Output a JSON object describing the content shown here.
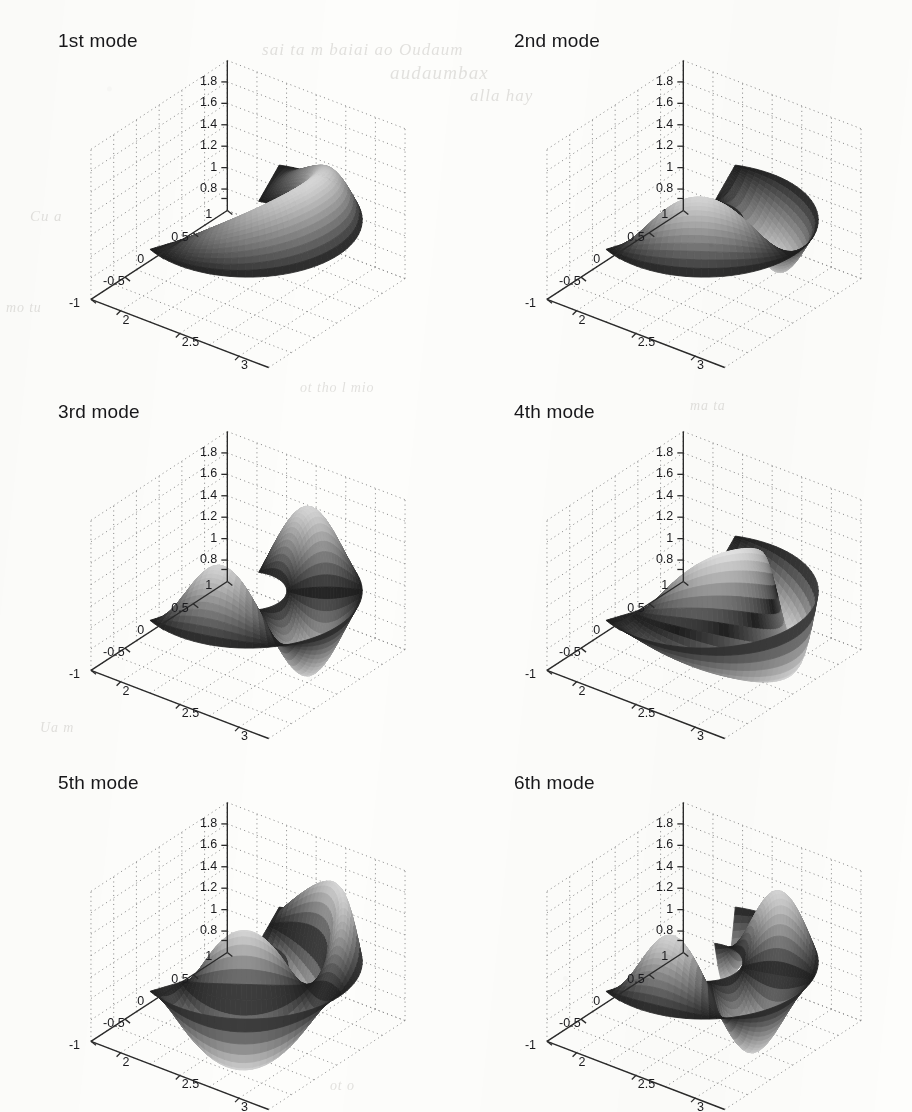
{
  "figure": {
    "kind": "multi-panel-3d-surface-figure",
    "rows": 3,
    "cols": 2,
    "background_color": "#fdfdfb",
    "ghost_text": [
      {
        "text": "sai ta m baiai ao Oudaum",
        "x": 262,
        "y": 40,
        "size": 17
      },
      {
        "text": "audaumbax",
        "x": 390,
        "y": 62,
        "size": 19
      },
      {
        "text": "alla  hay",
        "x": 470,
        "y": 86,
        "size": 17
      },
      {
        "text": "Cu a",
        "x": 30,
        "y": 208,
        "size": 15
      },
      {
        "text": "mo tu",
        "x": 6,
        "y": 300,
        "size": 14
      },
      {
        "text": "ot tho  l mio",
        "x": 300,
        "y": 380,
        "size": 14
      },
      {
        "text": "ma ta",
        "x": 690,
        "y": 398,
        "size": 14
      },
      {
        "text": "Ua  m",
        "x": 40,
        "y": 720,
        "size": 14
      },
      {
        "text": "ot o",
        "x": 330,
        "y": 1078,
        "size": 14
      }
    ]
  },
  "chart_data": [
    {
      "type": "surface",
      "title": "1st mode",
      "xlabel": "",
      "ylabel": "",
      "zlabel": "",
      "x_ticks": [
        "2",
        "2.5",
        "3"
      ],
      "y_ticks": [
        "1",
        "0.5",
        "0",
        "-0.5",
        "-1"
      ],
      "z_ticks": [
        "1.8",
        "1.6",
        "1.4",
        "1.2",
        "1",
        "0.8"
      ],
      "xlim": [
        1.75,
        3.25
      ],
      "ylim": [
        -1.15,
        1.15
      ],
      "zlim": [
        0.7,
        1.9
      ],
      "grid": true,
      "colormap": "gray",
      "domain": "annular-sector",
      "mode_index": 1,
      "nodal_circles": 0,
      "nodal_diameters": 0,
      "lobe_count": 1
    },
    {
      "type": "surface",
      "title": "2nd mode",
      "xlabel": "",
      "ylabel": "",
      "zlabel": "",
      "x_ticks": [
        "2",
        "2.5",
        "3"
      ],
      "y_ticks": [
        "1",
        "0.5",
        "0",
        "-0.5",
        "-1"
      ],
      "z_ticks": [
        "1.8",
        "1.6",
        "1.4",
        "1.2",
        "1",
        "0.8"
      ],
      "xlim": [
        1.75,
        3.25
      ],
      "ylim": [
        -1.15,
        1.15
      ],
      "zlim": [
        0.7,
        1.9
      ],
      "grid": true,
      "colormap": "gray",
      "domain": "annular-sector",
      "mode_index": 2,
      "nodal_circles": 0,
      "nodal_diameters": 1,
      "lobe_count": 2
    },
    {
      "type": "surface",
      "title": "3rd mode",
      "xlabel": "",
      "ylabel": "",
      "zlabel": "",
      "x_ticks": [
        "2",
        "2.5",
        "3"
      ],
      "y_ticks": [
        "1",
        "0.5",
        "0",
        "-0.5",
        "-1"
      ],
      "z_ticks": [
        "1.8",
        "1.6",
        "1.4",
        "1.2",
        "1",
        "0.8"
      ],
      "xlim": [
        1.75,
        3.25
      ],
      "ylim": [
        -1.15,
        1.15
      ],
      "zlim": [
        0.7,
        1.9
      ],
      "grid": true,
      "colormap": "gray",
      "domain": "annular-sector",
      "mode_index": 3,
      "nodal_circles": 0,
      "nodal_diameters": 2,
      "lobe_count": 3
    },
    {
      "type": "surface",
      "title": "4th mode",
      "xlabel": "",
      "ylabel": "",
      "zlabel": "",
      "x_ticks": [
        "2",
        "2.5",
        "3"
      ],
      "y_ticks": [
        "1",
        "0.5",
        "0",
        "-0.5",
        "-1"
      ],
      "z_ticks": [
        "1.8",
        "1.6",
        "1.4",
        "1.2",
        "1",
        "0.8"
      ],
      "xlim": [
        1.75,
        3.25
      ],
      "ylim": [
        -1.15,
        1.15
      ],
      "zlim": [
        0.7,
        1.9
      ],
      "grid": true,
      "colormap": "gray",
      "domain": "annular-sector",
      "mode_index": 4,
      "nodal_circles": 1,
      "nodal_diameters": 1,
      "lobe_count": 4
    },
    {
      "type": "surface",
      "title": "5th mode",
      "xlabel": "",
      "ylabel": "",
      "zlabel": "",
      "x_ticks": [
        "2",
        "2.5",
        "3"
      ],
      "y_ticks": [
        "1",
        "0.5",
        "0",
        "-0.5",
        "-1"
      ],
      "z_ticks": [
        "1.8",
        "1.6",
        "1.4",
        "1.2",
        "1",
        "0.8"
      ],
      "xlim": [
        1.75,
        3.25
      ],
      "ylim": [
        -1.15,
        1.15
      ],
      "zlim": [
        0.7,
        1.9
      ],
      "grid": true,
      "colormap": "gray",
      "domain": "annular-sector",
      "mode_index": 5,
      "nodal_circles": 1,
      "nodal_diameters": 2,
      "lobe_count": 4
    },
    {
      "type": "surface",
      "title": "6th mode",
      "xlabel": "",
      "ylabel": "",
      "zlabel": "",
      "x_ticks": [
        "2",
        "2.5",
        "3"
      ],
      "y_ticks": [
        "1",
        "0.5",
        "0",
        "-0.5",
        "-1"
      ],
      "z_ticks": [
        "1.8",
        "1.6",
        "1.4",
        "1.2",
        "1",
        "0.8"
      ],
      "xlim": [
        1.75,
        3.25
      ],
      "ylim": [
        -1.15,
        1.15
      ],
      "zlim": [
        0.7,
        1.9
      ],
      "grid": true,
      "colormap": "gray",
      "domain": "annular-sector",
      "mode_index": 6,
      "nodal_circles": 0,
      "nodal_diameters": 3,
      "lobe_count": 4
    }
  ]
}
